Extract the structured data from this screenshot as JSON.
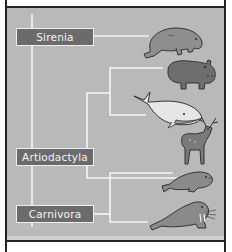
{
  "diagram": {
    "type": "phylogenetic-tree",
    "groups": [
      {
        "id": "sirenia",
        "label": "Sirenia",
        "members": [
          "manatee"
        ]
      },
      {
        "id": "artiodactyla",
        "label": "Artiodactyla",
        "members": [
          "hippopotamus",
          "whale",
          "deer"
        ]
      },
      {
        "id": "carnivora",
        "label": "Carnivora",
        "members": [
          "seal",
          "walrus"
        ]
      }
    ],
    "leaves": [
      {
        "id": "manatee",
        "icon": "manatee-icon"
      },
      {
        "id": "hippopotamus",
        "icon": "hippo-icon"
      },
      {
        "id": "whale",
        "icon": "whale-icon"
      },
      {
        "id": "deer",
        "icon": "deer-icon"
      },
      {
        "id": "seal",
        "icon": "seal-icon"
      },
      {
        "id": "walrus",
        "icon": "walrus-icon"
      }
    ],
    "colors": {
      "panel": "#b9b9b9",
      "branch": "#f5f5f5",
      "label_bg": "#6b6b6b",
      "label_text": "#f4f4f4",
      "frame": "#222222"
    }
  }
}
